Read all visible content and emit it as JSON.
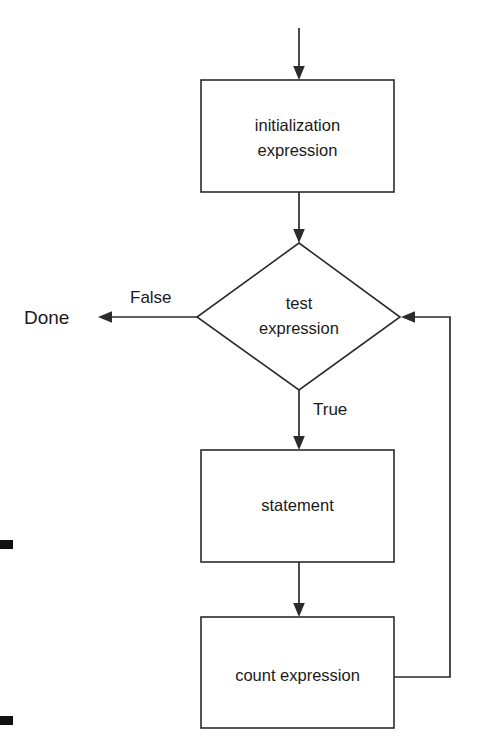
{
  "diagram": {
    "type": "flowchart",
    "background_color": "#ffffff",
    "line_color": "#2b2b2b",
    "text_color": "#1a1a1a",
    "nodes": [
      {
        "id": "initialization",
        "shape": "process",
        "line1": "initialization",
        "line2": "expression"
      },
      {
        "id": "test",
        "shape": "decision",
        "line1": "test",
        "line2": "expression"
      },
      {
        "id": "statement",
        "shape": "process",
        "line1": "statement",
        "line2": ""
      },
      {
        "id": "count",
        "shape": "process",
        "line1": "count expression",
        "line2": ""
      }
    ],
    "edge_labels": {
      "false": "False",
      "true": "True"
    },
    "terminals": {
      "done": "Done"
    }
  }
}
